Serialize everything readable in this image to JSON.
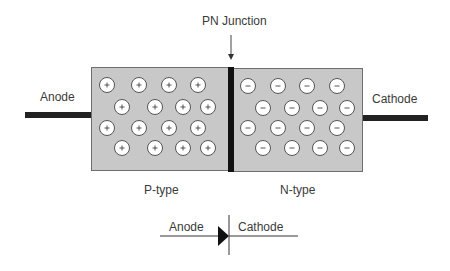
{
  "title": "PN Junction",
  "labels": {
    "junction": "PN Junction",
    "anode": "Anode",
    "cathode": "Cathode",
    "p_region": "P-type",
    "n_region": "N-type",
    "symbol_anode": "Anode",
    "symbol_cathode": "Cathode"
  },
  "p_region": {
    "carrier_symbol": "+",
    "fill": "#c8c8c8",
    "carriers": [
      [
        107,
        85
      ],
      [
        139,
        85
      ],
      [
        169,
        85
      ],
      [
        198,
        85
      ],
      [
        122,
        107
      ],
      [
        155,
        107
      ],
      [
        183,
        107
      ],
      [
        208,
        107
      ],
      [
        107,
        128
      ],
      [
        139,
        128
      ],
      [
        169,
        128
      ],
      [
        198,
        128
      ],
      [
        122,
        148
      ],
      [
        155,
        148
      ],
      [
        183,
        148
      ],
      [
        208,
        148
      ]
    ]
  },
  "n_region": {
    "carrier_symbol": "−",
    "fill": "#c8c8c8",
    "carriers": [
      [
        248,
        86
      ],
      [
        278,
        86
      ],
      [
        307,
        86
      ],
      [
        337,
        86
      ],
      [
        263,
        108
      ],
      [
        292,
        108
      ],
      [
        320,
        108
      ],
      [
        347,
        108
      ],
      [
        248,
        128
      ],
      [
        278,
        128
      ],
      [
        307,
        128
      ],
      [
        337,
        128
      ],
      [
        263,
        148
      ],
      [
        292,
        148
      ],
      [
        320,
        148
      ],
      [
        347,
        148
      ]
    ]
  },
  "colors": {
    "box_fill": "#c8c8c8",
    "box_stroke": "#777777",
    "lead": "#222222",
    "junction_bar": "#111111",
    "carrier_fill": "#ffffff",
    "carrier_stroke": "#555555"
  }
}
